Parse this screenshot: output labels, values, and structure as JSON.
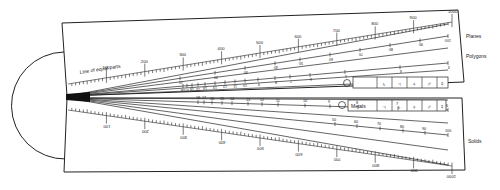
{
  "diagram": {
    "type": "sector-instrument",
    "colors": {
      "ink": "#1a1a1a",
      "paper": "#ffffff"
    },
    "hinge": {
      "shape": "semicircle"
    },
    "upper_arm": {
      "scales": [
        {
          "name": "Line of equal parts",
          "label": "Line of equal parts",
          "ticks": [
            "100",
            "200",
            "300",
            "400",
            "500",
            "600",
            "700",
            "800",
            "900",
            "1000"
          ]
        },
        {
          "name": "Planes",
          "label": "Planes",
          "ticks": [
            "10",
            "20",
            "30",
            "40",
            "50",
            "60",
            "70",
            "80",
            "90",
            "100"
          ]
        },
        {
          "name": "Polygons",
          "label": "Polygons",
          "ticks": [
            "3",
            "4",
            "5",
            "6",
            "7",
            "8",
            "9",
            "10",
            "11",
            "12",
            "13",
            "14",
            "15",
            "16",
            "17",
            "18"
          ]
        }
      ],
      "symbol_box": {
        "circle_symbol": "☉",
        "cells": [
          "♄",
          "♃",
          "♀",
          "♂",
          "☿"
        ]
      }
    },
    "lower_arm": {
      "scales": [
        {
          "name": "Metals",
          "label": "Metals",
          "ticks": [
            "18",
            "17",
            "16",
            "15",
            "14",
            "13",
            "12",
            "11",
            "10",
            "9",
            "8",
            "7",
            "6"
          ]
        },
        {
          "name": "Solids",
          "label": "Solids",
          "ticks": [
            "50",
            "60",
            "70",
            "80",
            "90",
            "100"
          ]
        },
        {
          "name": "Line of equal parts (lower)",
          "label": "",
          "ticks": [
            "100",
            "200",
            "300",
            "400",
            "500",
            "600",
            "700",
            "800",
            "900",
            "1000"
          ]
        }
      ],
      "symbol_box": {
        "circle_symbol": "☉",
        "label": "Metals",
        "cells": [
          "♃",
          "♄",
          "♀",
          "♂",
          "☿"
        ]
      }
    }
  }
}
